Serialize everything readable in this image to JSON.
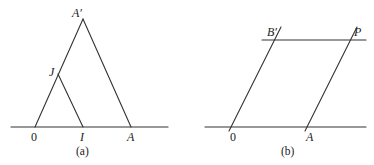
{
  "figure": {
    "panels": [
      {
        "id": "a",
        "caption": "(a)",
        "points": {
          "origin": "0",
          "I": "I",
          "A": "A",
          "A_prime": "A′",
          "J": "J"
        },
        "segments": [
          "0–A′",
          "A′–A",
          "J–I",
          "baseline"
        ]
      },
      {
        "id": "b",
        "caption": "(b)",
        "points": {
          "origin": "0",
          "A": "A",
          "B_prime": "B′",
          "P": "P"
        },
        "segments": [
          "0–B′",
          "A–P",
          "B′–P line",
          "baseline"
        ]
      }
    ]
  }
}
